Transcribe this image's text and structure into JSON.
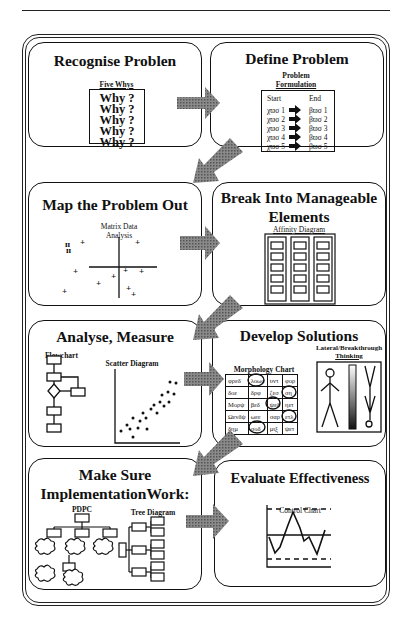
{
  "panels": [
    {
      "id": "recognise",
      "title": "Recognise Problen",
      "tool": {
        "label": "Five Whys",
        "lines": [
          "Why  ?",
          "Why  ?",
          "Why  ?",
          "Why  ?",
          "Why  ?"
        ]
      }
    },
    {
      "id": "define",
      "title": "Define Problem",
      "tool": {
        "label_line1": "Problem",
        "label_line2": "Formulation",
        "start_header": "Start",
        "end_header": "End",
        "rows": [
          {
            "start": "χϖσ 1",
            "end": "βϖσ 1"
          },
          {
            "start": "χϖσ 2",
            "end": "βϖσ 2"
          },
          {
            "start": "χϖσ 3",
            "end": "βϖσ 3"
          },
          {
            "start": "χϖσ 4",
            "end": "βϖσ 4"
          },
          {
            "start": "χϖσ 5",
            "end": "βϖσ 5"
          }
        ]
      }
    },
    {
      "id": "map",
      "title": "Map the Problem Out",
      "tool": {
        "label_line1": "Matrix Data",
        "label_line2": "Analysis"
      }
    },
    {
      "id": "break",
      "title_line1": "Break Into Manageable",
      "title_line2": "Elements",
      "tool": {
        "label": "Affinity Diagram",
        "columns": 3,
        "boxes_per_column": 5
      }
    },
    {
      "id": "analyse",
      "title": "Analyse, Measure",
      "tool": {
        "flowchart_label": "Flowchart",
        "scatter_label": "Scatter Diagram"
      }
    },
    {
      "id": "develop",
      "title": "Develop Solutions",
      "tool": {
        "morph_label": "Morphology Chart",
        "lateral_label_line1": "Lateral/Breakthrough",
        "lateral_label_line2": "Thinking",
        "morph_rows": [
          [
            "φρεδ",
            "λοωσ",
            "υντ",
            "φορ"
          ],
          [
            "δοε",
            "δρφ",
            "ζεσ",
            "ση"
          ],
          [
            "Μορψ",
            "βεδ",
            "ψεδ",
            "ηετ"
          ],
          [
            "Ωενδψ",
            "ωεε",
            "σαρ",
            "ετλ"
          ],
          [
            "δημ",
            "σοδ",
            "μιξ",
            "ψετ"
          ]
        ]
      }
    },
    {
      "id": "implement",
      "title_line1": "Make Sure",
      "title_line2": "ImplementationWork:",
      "tool": {
        "pdpc_label": "PDPC",
        "tree_label": "Tree Diagram"
      }
    },
    {
      "id": "evaluate",
      "title": "Evaluate Effectiveness",
      "tool": {
        "label": "Control Chart"
      }
    }
  ],
  "colors": {
    "arrow": "#6e6e6e",
    "line": "#111111"
  }
}
